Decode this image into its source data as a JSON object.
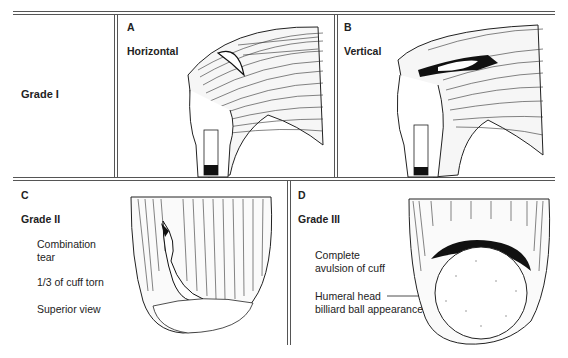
{
  "figure": {
    "rows": [
      {
        "row_label": "Grade I",
        "panels": [
          {
            "letter": "A",
            "title": "Horizontal"
          },
          {
            "letter": "B",
            "title": "Vertical"
          }
        ]
      }
    ],
    "panel_c": {
      "letter": "C",
      "grade": "Grade II",
      "notes": [
        "Combination",
        "tear",
        "1/3 of cuff torn",
        "Superior view"
      ]
    },
    "panel_d": {
      "letter": "D",
      "grade": "Grade III",
      "notes": [
        "Complete",
        "avulsion of cuff",
        "Humeral head",
        "billiard ball appearance"
      ]
    },
    "colors": {
      "rule": "#555555",
      "ink": "#222222",
      "background": "#ffffff"
    }
  }
}
